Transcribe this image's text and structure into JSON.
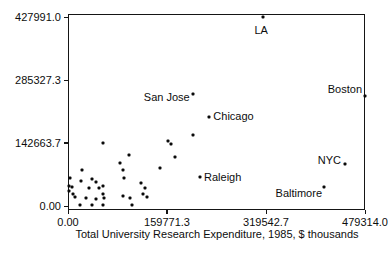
{
  "chart_data": {
    "type": "scatter",
    "title": "",
    "xlabel": "Total University Research Expenditure, 1985, $ thousands",
    "ylabel": "",
    "xlim": [
      0,
      479314.0
    ],
    "ylim": [
      0,
      427991.0
    ],
    "grid": false,
    "legend": "none",
    "marker_color": "#0a0a0a",
    "frame_color": "#151515",
    "x_ticks": {
      "values": [
        0,
        159771.3,
        319542.7,
        479314.0
      ],
      "labels": [
        "0.00",
        "159771.3",
        "319542.7",
        "479314.0"
      ]
    },
    "y_ticks": {
      "values": [
        0,
        142663.7,
        285327.3,
        427991.0
      ],
      "labels": [
        "0.00",
        "142663.7",
        "285327.3",
        "427991.0"
      ]
    },
    "labeled_points": [
      {
        "label": "LA",
        "x": 315000,
        "y": 427991,
        "align": "center",
        "dx": -2,
        "dy": 13
      },
      {
        "label": "San Jose",
        "x": 201300,
        "y": 252900,
        "align": "end",
        "dx": -3,
        "dy": 3
      },
      {
        "label": "Chicago",
        "x": 228100,
        "y": 200900,
        "align": "start",
        "dx": 4,
        "dy": -1
      },
      {
        "label": "Boston",
        "x": 479314,
        "y": 249800,
        "align": "end",
        "dx": -3,
        "dy": -7
      },
      {
        "label": "NYC",
        "x": 447100,
        "y": 96200,
        "align": "end",
        "dx": -4,
        "dy": -4
      },
      {
        "label": "Raleigh",
        "x": 213100,
        "y": 66300,
        "align": "start",
        "dx": 4,
        "dy": 0
      },
      {
        "label": "Baltimore",
        "x": 413200,
        "y": 41900,
        "align": "end",
        "dx": -2,
        "dy": 6
      }
    ],
    "points": [
      [
        56300,
        143300
      ],
      [
        99000,
        115500
      ],
      [
        83900,
        96700
      ],
      [
        88100,
        82600
      ],
      [
        148500,
        85400
      ],
      [
        162000,
        147200
      ],
      [
        166100,
        141500
      ],
      [
        201500,
        161700
      ],
      [
        172700,
        110300
      ],
      [
        22600,
        81500
      ],
      [
        3200,
        63400
      ],
      [
        20500,
        56600
      ],
      [
        38300,
        61100
      ],
      [
        45200,
        53700
      ],
      [
        1600,
        46000
      ],
      [
        34400,
        41400
      ],
      [
        50500,
        41400
      ],
      [
        2100,
        34000
      ],
      [
        11300,
        21100
      ],
      [
        29000,
        18800
      ],
      [
        56000,
        46000
      ],
      [
        7600,
        26500
      ],
      [
        45200,
        15900
      ],
      [
        58600,
        18800
      ],
      [
        19400,
        2300
      ],
      [
        38700,
        2300
      ],
      [
        56000,
        2300
      ],
      [
        90400,
        62700
      ],
      [
        117300,
        51400
      ],
      [
        124300,
        41400
      ],
      [
        56000,
        26500
      ],
      [
        89300,
        23300
      ],
      [
        100100,
        18800
      ],
      [
        120600,
        26500
      ],
      [
        127000,
        21100
      ],
      [
        102800,
        2300
      ],
      [
        6500,
        43700
      ]
    ]
  }
}
